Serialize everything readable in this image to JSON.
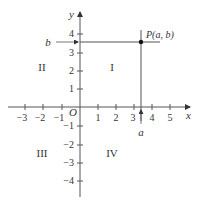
{
  "diagram": {
    "axes": {
      "x_label": "x",
      "y_label": "y",
      "origin_label": "O",
      "x_ticks": [
        -3,
        -2,
        -1,
        1,
        2,
        3,
        4,
        5
      ],
      "x_tick_labels": [
        "−3",
        "−2",
        "−1",
        "1",
        "2",
        "3",
        "4",
        "5"
      ],
      "y_ticks": [
        4,
        3,
        2,
        1,
        -1,
        -2,
        -3,
        -4
      ],
      "y_tick_labels": [
        "4",
        "3",
        "2",
        "1",
        "−1",
        "−2",
        "−3",
        "−4"
      ]
    },
    "quadrants": {
      "I": "I",
      "II": "II",
      "III": "III",
      "IV": "IV"
    },
    "point": {
      "label": "P(a, b)",
      "x": 3.4,
      "y": 3.5
    },
    "projection_labels": {
      "a": "a",
      "b": "b"
    },
    "colors": {
      "line": "#555555",
      "text": "#333333",
      "point": "#111111"
    }
  }
}
